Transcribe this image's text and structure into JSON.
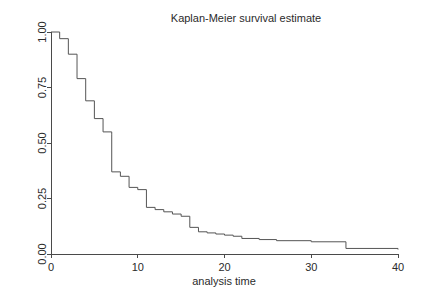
{
  "figure": {
    "title": "Kaplan-Meier survival estimate",
    "background_color": "#ffffff",
    "curve_color": "#555555",
    "axis_color": "#4a4a4a",
    "text_color": "#2b2b2b"
  },
  "chart_data": {
    "type": "line",
    "subtype": "step-post",
    "title": "Kaplan-Meier survival estimate",
    "xlabel": "analysis time",
    "ylabel": "",
    "xlim": [
      0,
      40
    ],
    "ylim": [
      0,
      1
    ],
    "grid": false,
    "legend": null,
    "xticks": [
      0,
      10,
      20,
      30,
      40
    ],
    "xticklabels": [
      "0",
      "10",
      "20",
      "30",
      "40"
    ],
    "yticks": [
      0.0,
      0.25,
      0.5,
      0.75,
      1.0
    ],
    "yticklabels": [
      "0.00",
      "0.25",
      "0.50",
      "0.75",
      "1.00"
    ],
    "ytick_rotation": 90,
    "series": [
      {
        "name": "survival",
        "x": [
          0,
          1,
          2,
          3,
          4,
          5,
          6,
          7,
          7,
          8,
          9,
          10,
          11,
          12,
          13,
          14,
          15,
          16,
          17,
          18,
          19,
          20,
          21,
          22,
          24,
          26,
          30,
          34,
          40
        ],
        "y": [
          1.0,
          0.97,
          0.9,
          0.79,
          0.69,
          0.61,
          0.55,
          0.54,
          0.37,
          0.35,
          0.3,
          0.29,
          0.21,
          0.2,
          0.19,
          0.18,
          0.17,
          0.12,
          0.1,
          0.095,
          0.09,
          0.085,
          0.08,
          0.07,
          0.065,
          0.06,
          0.055,
          0.025,
          0.02
        ]
      }
    ]
  },
  "geometry": {
    "plot_left": 51,
    "plot_right": 398,
    "plot_top": 32,
    "plot_bottom": 254,
    "title_x": 246,
    "title_y": 22,
    "xlabel_x": 224,
    "xlabel_y": 285
  }
}
